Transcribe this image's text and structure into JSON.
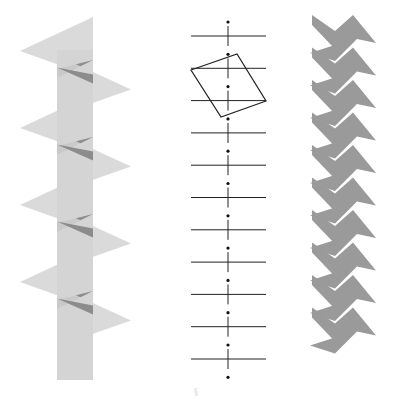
{
  "figure": {
    "width": 398,
    "height": 412,
    "background": "#ffffff",
    "panels": [
      {
        "id": "left",
        "description": "Glide-reflected translucent triangles stacked along a vertical strip",
        "strip": {
          "x": 57,
          "y": 50,
          "width": 36,
          "height": 330
        },
        "triangles_count": 8,
        "colors": {
          "light": "#d4d4d4",
          "overlap": "#8c8c8c"
        }
      },
      {
        "id": "middle",
        "description": "Vertical axis with dots, horizontal lines and a tilted rectangle",
        "axis_x": 228,
        "dots_count": 12,
        "horizontal_lines_count": 11,
        "line_x_range": [
          191,
          266
        ],
        "rectangle": {
          "points": [
            [
              191,
              70
            ],
            [
              237,
              54
            ],
            [
              266,
              101
            ],
            [
              221,
              117
            ]
          ]
        },
        "colors": {
          "stroke": "#222222",
          "dot": "#111111"
        }
      },
      {
        "id": "right",
        "description": "Zigzag band of grey kite-like shapes forming white diamonds",
        "units_count": 10,
        "colors": {
          "fill": "#9a9a9a"
        }
      }
    ],
    "footer_mark": "§"
  }
}
